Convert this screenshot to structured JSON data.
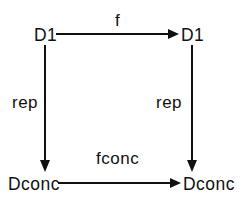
{
  "diagram": {
    "type": "commutative-diagram",
    "nodes": {
      "top_left": "D1",
      "top_right": "D1",
      "bottom_left": "Dconc",
      "bottom_right": "Dconc"
    },
    "edges": {
      "top": {
        "label": "f",
        "from": "top_left",
        "to": "top_right"
      },
      "bottom": {
        "label": "fconc",
        "from": "bottom_left",
        "to": "bottom_right"
      },
      "left": {
        "label": "rep",
        "from": "top_left",
        "to": "bottom_left"
      },
      "right": {
        "label": "rep",
        "from": "top_right",
        "to": "bottom_right"
      }
    },
    "colors": {
      "line": "#111111",
      "background": "#ffffff"
    }
  }
}
